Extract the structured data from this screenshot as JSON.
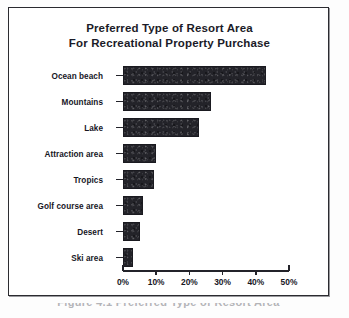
{
  "chart_data": {
    "type": "bar",
    "orientation": "horizontal",
    "title": "Preferred Type of Resort Area For Recreational Property Purchase",
    "title_lines": [
      "Preferred Type of Resort Area",
      "For Recreational Property Purchase"
    ],
    "categories": [
      "Ocean beach",
      "Mountains",
      "Lake",
      "Attraction area",
      "Tropics",
      "Golf course area",
      "Desert",
      "Ski area"
    ],
    "values": [
      43,
      26.5,
      23,
      10,
      9.3,
      6,
      5,
      3
    ],
    "xlabel": "",
    "ylabel": "",
    "xlim": [
      0,
      50
    ],
    "xticks": [
      0,
      10,
      20,
      30,
      40,
      50
    ],
    "xtick_labels": [
      "0%",
      "10%",
      "20%",
      "30%",
      "40%",
      "50%"
    ],
    "grid": false,
    "legend": false,
    "bar_color": "#232329",
    "axis_color": "#23232a",
    "text_color": "#17171f"
  },
  "figure": {
    "frame_color": "#2b2b30",
    "background": "#ffffff",
    "bottom_caption": "Figure 4.1 Preferred Type of Resort Area"
  }
}
